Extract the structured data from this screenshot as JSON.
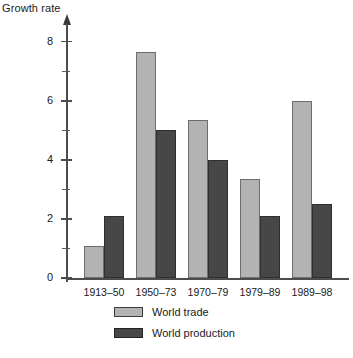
{
  "chart_data": {
    "type": "bar",
    "title": "",
    "ylabel": "Growth rate",
    "xlabel": "",
    "categories": [
      "1913–50",
      "1950–73",
      "1970–79",
      "1979–89",
      "1989–98"
    ],
    "series": [
      {
        "name": "World trade",
        "color": "#b3b3b3",
        "values": [
          1.1,
          7.65,
          5.35,
          3.35,
          6.0
        ]
      },
      {
        "name": "World production",
        "color": "#474747",
        "values": [
          2.1,
          5.0,
          4.0,
          2.1,
          2.5
        ]
      }
    ],
    "ylim": [
      0,
      8.6
    ],
    "y_major_ticks": [
      0,
      2,
      4,
      6,
      8
    ],
    "y_minor_ticks": [
      1,
      3,
      5,
      7
    ],
    "y_tick_labels": [
      "0",
      "2",
      "4",
      "6",
      "8"
    ],
    "grid": false,
    "legend_position": "bottom-center"
  },
  "legend": {
    "entries": [
      {
        "label": "World trade",
        "swatch": "trade"
      },
      {
        "label": "World production",
        "swatch": "production"
      }
    ]
  },
  "footer": {
    "caption": ""
  }
}
